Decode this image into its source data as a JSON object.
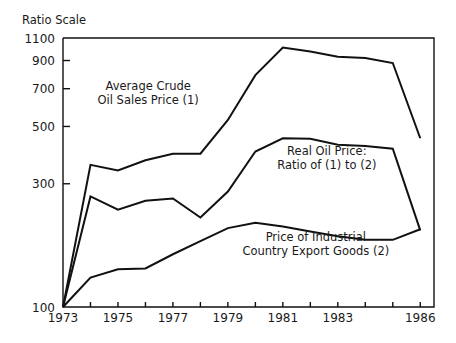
{
  "figure": {
    "scale_note": "Ratio Scale",
    "background": "#ffffff",
    "ink_color": "#111111"
  },
  "chart_data": {
    "type": "line",
    "title": "",
    "subtitle": "",
    "xlabel": "",
    "ylabel": "Ratio Scale",
    "scale": "logarithmic",
    "grid": false,
    "legend_position": "inline-annotations",
    "xlim": [
      1973,
      1986.5
    ],
    "ylim": [
      100,
      1100
    ],
    "x": [
      1973,
      1974,
      1975,
      1976,
      1977,
      1978,
      1979,
      1980,
      1981,
      1982,
      1983,
      1984,
      1985,
      1986
    ],
    "xtick_labels": [
      "1973",
      "1975",
      "1977",
      "1979",
      "1981",
      "1983",
      "1986"
    ],
    "xtick_values": [
      1973,
      1975,
      1977,
      1979,
      1981,
      1983,
      1986
    ],
    "ytick_labels": [
      "100",
      "300",
      "500",
      "700",
      "900",
      "1100"
    ],
    "ytick_values": [
      100,
      300,
      500,
      700,
      900,
      1100
    ],
    "series": [
      {
        "name": "Average Crude Oil Sales Price (1)",
        "label_line1": "Average Crude",
        "label_line2": "Oil Sales Price (1)",
        "values": [
          100,
          355,
          338,
          370,
          392,
          392,
          530,
          790,
          1010,
          975,
          930,
          920,
          880,
          450
        ]
      },
      {
        "name": "Real Oil Price: Ratio of (1) to (2)",
        "label_line1": "Real Oil Price:",
        "label_line2": "Ratio of (1) to (2)",
        "values": [
          100,
          268,
          238,
          258,
          263,
          222,
          280,
          400,
          450,
          448,
          425,
          420,
          410,
          198
        ]
      },
      {
        "name": "Price of Industrial Country Export Goods (2)",
        "label_line1": "Price of Industrial",
        "label_line2": "Country Export Goods (2)",
        "values": [
          100,
          130,
          140,
          141,
          160,
          180,
          202,
          212,
          205,
          196,
          188,
          182,
          182,
          200
        ]
      }
    ],
    "annotations": [
      {
        "text_line1": "Average Crude",
        "text_line2": "Oil Sales Price (1)",
        "x": 1976.1,
        "y_px": 90
      },
      {
        "text_line1": "Real Oil Price:",
        "text_line2": "Ratio of (1) to (2)",
        "x": 1982.6,
        "y_px": 155
      },
      {
        "text_line1": "Price of Industrial",
        "text_line2": "Country Export Goods (2)",
        "x": 1982.2,
        "y_px": 241
      }
    ]
  }
}
